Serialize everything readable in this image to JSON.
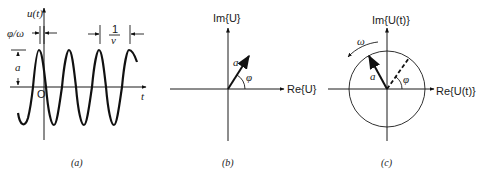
{
  "panels": [
    {
      "id": "a",
      "caption": "(a)",
      "y_axis_label": "u(t)",
      "x_axis_label": "t",
      "origin_label": "O",
      "phase_offset_label": "φ/ω",
      "period_label_numerator": "1",
      "period_label_denominator": "ν",
      "amplitude_label": "a"
    },
    {
      "id": "b",
      "caption": "(b)",
      "im_axis_label": "Im{U}",
      "re_axis_label": "Re{U}",
      "vector_label": "a",
      "angle_label": "φ"
    },
    {
      "id": "c",
      "caption": "(c)",
      "im_axis_label": "Im{U(t)}",
      "re_axis_label": "Re{U(t)}",
      "vector_label": "a",
      "angle_label": "φ",
      "rotation_label": "ω"
    }
  ],
  "colors": {
    "ink": "#1a1a1a",
    "background": "#ffffff"
  }
}
